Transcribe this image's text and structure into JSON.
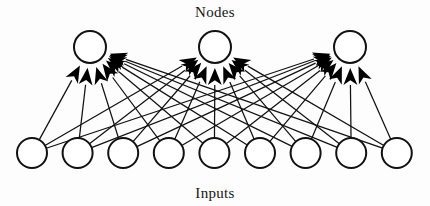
{
  "figure": {
    "kind": "neural-network-diagram",
    "top_label": "Nodes",
    "bottom_label": "Inputs",
    "background_color": "#fdfdfd",
    "stroke_color": "#111111",
    "arrow_color": "#000000",
    "node_fill": "#ffffff"
  },
  "layers": {
    "nodes": {
      "label": "Nodes",
      "count": 3,
      "radius": 16,
      "cy": 47,
      "centers_x": [
        90,
        215,
        350
      ]
    },
    "inputs": {
      "label": "Inputs",
      "count": 9,
      "radius": 15,
      "cy": 153,
      "centers_x": [
        32,
        77.6,
        123.2,
        168.8,
        214.4,
        260,
        305.6,
        351.2,
        396.8
      ]
    }
  },
  "connections": {
    "style": "fully-connected",
    "total_edges": 27,
    "arrowheads": true,
    "arrowhead_length": 17,
    "arrowhead_half_width": 7,
    "arrow_gap_from_node": 17
  },
  "captions": {
    "top": {
      "text": "Nodes",
      "x": 215,
      "y": 17
    },
    "bottom": {
      "text": "Inputs",
      "x": 215,
      "y": 198
    }
  }
}
